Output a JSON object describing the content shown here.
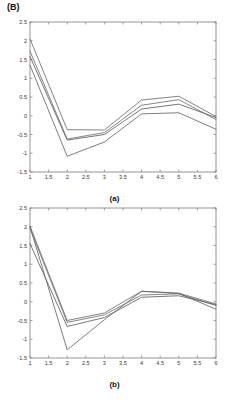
{
  "figure": {
    "panel_letter": "(B)"
  },
  "chart_data": [
    {
      "id": "a",
      "type": "line",
      "title": "",
      "subfigure_label": "(a)",
      "xlabel": "No. of coefficients",
      "ylabel": "",
      "xlim": [
        1,
        6
      ],
      "ylim": [
        -1.5,
        2.5
      ],
      "xticks": [
        1,
        1.5,
        2,
        2.5,
        3,
        3.5,
        4,
        4.5,
        5,
        5.5,
        6
      ],
      "xticklabels": [
        "1",
        "1.5",
        "2",
        "2.5",
        "3",
        "3.5",
        "4",
        "4.5",
        "5",
        "5.5",
        "6"
      ],
      "yticks": [
        -1.5,
        -1,
        -0.5,
        0,
        0.5,
        1,
        1.5,
        2,
        2.5
      ],
      "yticklabels": [
        "-1.5",
        "-1",
        "-0.5",
        "0",
        "0.5",
        "1",
        "1.5",
        "2",
        "2.5"
      ],
      "grid": false,
      "legend": "none",
      "x": [
        1,
        2,
        3,
        4,
        5,
        6
      ],
      "series": [
        {
          "name": "series-1",
          "color": "#6b6b6b",
          "values": [
            2.05,
            -0.37,
            -0.38,
            0.42,
            0.52,
            -0.02
          ]
        },
        {
          "name": "series-2",
          "color": "#707070",
          "values": [
            1.72,
            -0.62,
            -0.45,
            0.28,
            0.43,
            -0.1
          ]
        },
        {
          "name": "series-3",
          "color": "#5f5f5f",
          "values": [
            1.58,
            -0.65,
            -0.5,
            0.18,
            0.31,
            -0.05
          ]
        },
        {
          "name": "series-4",
          "color": "#666666",
          "values": [
            1.35,
            -1.08,
            -0.7,
            0.05,
            0.08,
            -0.36
          ]
        }
      ]
    },
    {
      "id": "b",
      "type": "line",
      "title": "",
      "subfigure_label": "(b)",
      "xlabel": "No. of coefficients",
      "ylabel": "",
      "xlim": [
        1,
        6
      ],
      "ylim": [
        -1.5,
        2.5
      ],
      "xticks": [
        1,
        1.5,
        2,
        2.5,
        3,
        3.5,
        4,
        4.5,
        5,
        5.5,
        6
      ],
      "xticklabels": [
        "1",
        "1.5",
        "2",
        "2.5",
        "3",
        "3.5",
        "4",
        "4.5",
        "5",
        "5.5",
        "6"
      ],
      "yticks": [
        -1.5,
        -1,
        -0.5,
        0,
        0.5,
        1,
        1.5,
        2,
        2.5
      ],
      "yticklabels": [
        "-1.5",
        "-1",
        "-0.5",
        "0",
        "0.5",
        "1",
        "1.5",
        "2",
        "2.5"
      ],
      "grid": false,
      "legend": "none",
      "x": [
        1,
        2,
        3,
        4,
        5,
        6
      ],
      "series": [
        {
          "name": "series-1",
          "color": "#6b6b6b",
          "values": [
            2.02,
            -0.5,
            -0.3,
            0.28,
            0.23,
            -0.06
          ]
        },
        {
          "name": "series-2",
          "color": "#707070",
          "values": [
            1.96,
            -0.55,
            -0.35,
            0.18,
            0.21,
            -0.1
          ]
        },
        {
          "name": "series-3",
          "color": "#5f5f5f",
          "values": [
            1.55,
            -0.66,
            -0.42,
            0.12,
            0.16,
            -0.08
          ]
        },
        {
          "name": "series-4",
          "color": "#666666",
          "values": [
            2.0,
            -1.28,
            -0.48,
            0.28,
            0.22,
            -0.2
          ]
        }
      ]
    }
  ]
}
